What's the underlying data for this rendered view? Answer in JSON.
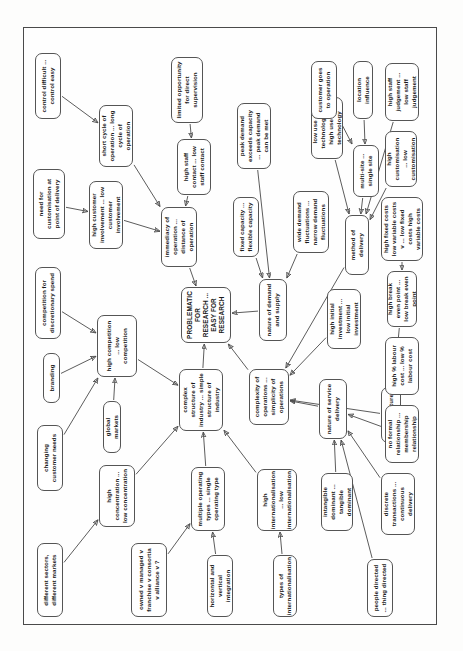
{
  "diagram": {
    "type": "concept-map",
    "title": "PROBLEMATIC FOR RESEARCH ... EASY FOR RESEARCH",
    "orientation": "rotated-90",
    "nodes": [
      {
        "id": "different-sectors",
        "label": "different sectors, different markets"
      },
      {
        "id": "changing-customer-needs",
        "label": "changing customer needs"
      },
      {
        "id": "branding",
        "label": "branding"
      },
      {
        "id": "competition-discretionary",
        "label": "competition for discretionary spend"
      },
      {
        "id": "need-customisation",
        "label": "need for customisation at point of delivery"
      },
      {
        "id": "control-difficult",
        "label": "control difficult ... control easy"
      },
      {
        "id": "high-concentration",
        "label": "high concentration ... low concentration"
      },
      {
        "id": "global-markets",
        "label": "global markets"
      },
      {
        "id": "high-competition",
        "label": "high competition ... low competition"
      },
      {
        "id": "high-customer-involvement",
        "label": "high customer involvement ... low customer involvement"
      },
      {
        "id": "short-cycle",
        "label": "short cycle of operation ... long cycle of operation"
      },
      {
        "id": "owned-v-managed",
        "label": "owned v managed v franchise v consortia v alliance v ?"
      },
      {
        "id": "immediacy-of-operation",
        "label": "immediacy of operation ... distance of operation"
      },
      {
        "id": "high-staff-contact",
        "label": "high staff contact ... low staff contact"
      },
      {
        "id": "limited-supervision",
        "label": "limited opportunity for direct supervision"
      },
      {
        "id": "multiple-operating-types",
        "label": "multiple operating types ... single operating type"
      },
      {
        "id": "complex-structure",
        "label": "complex structure of industry ... simple structure of industry"
      },
      {
        "id": "problematic-research",
        "label": "PROBLEMATIC FOR RESEARCH ... EASY FOR RESEARCH"
      },
      {
        "id": "fixed-capacity",
        "label": "fixed capacity ... flexible capacity"
      },
      {
        "id": "peak-demand",
        "label": "peak demand exceeds capacity ... peak demand can be met"
      },
      {
        "id": "horizontal-vertical",
        "label": "horizontal and vertical integration"
      },
      {
        "id": "high-internationalisation",
        "label": "high internationalisation ... low internationalisation"
      },
      {
        "id": "complexity-operations",
        "label": "complexity of operations ... simplicity of operations"
      },
      {
        "id": "nature-demand-supply",
        "label": "nature of demand and supply"
      },
      {
        "id": "wide-demand-fluctuations",
        "label": "wide demand fluctuations ... narrow demand fluctuations"
      },
      {
        "id": "low-use-technology",
        "label": "low use of technology ... high use of technology"
      },
      {
        "id": "types-internationalisation",
        "label": "types of internationalisation"
      },
      {
        "id": "intangible-dominant",
        "label": "intangible dominant ... tangible dominant"
      },
      {
        "id": "nature-service-delivery",
        "label": "nature of service delivery"
      },
      {
        "id": "cost-structure",
        "label": "cost structure"
      },
      {
        "id": "high-initial-investment",
        "label": "high initial investment ... low initial investment"
      },
      {
        "id": "method-of-delivery",
        "label": "method of delivery"
      },
      {
        "id": "multi-site",
        "label": "multi-site ... single site"
      },
      {
        "id": "location-influence",
        "label": "location influence"
      },
      {
        "id": "people-directed",
        "label": "people directed ... thing directed"
      },
      {
        "id": "discrete-transactions",
        "label": "discrete transactions ... continuous delivery"
      },
      {
        "id": "no-formal-relationship",
        "label": "no formal relationship ... membership relationship"
      },
      {
        "id": "high-labour-cost",
        "label": "high % labour cost ... low % labour cost"
      },
      {
        "id": "high-break-even",
        "label": "high break even point ... low break even point"
      },
      {
        "id": "high-fixed-costs",
        "label": "high fixed costs low variable costs v ... low fixed costs high variable costs"
      },
      {
        "id": "high-customisation",
        "label": "high customisation ... low customisation"
      },
      {
        "id": "high-staff-judgement",
        "label": "high staff judgement ... low staff judgement"
      },
      {
        "id": "customer-goes-to-operation",
        "label": "customer goes to operation"
      }
    ],
    "edges": [
      {
        "from": "different-sectors",
        "to": "high-concentration"
      },
      {
        "from": "changing-customer-needs",
        "to": "high-competition"
      },
      {
        "from": "branding",
        "to": "high-competition"
      },
      {
        "from": "competition-discretionary",
        "to": "high-competition"
      },
      {
        "from": "global-markets",
        "to": "high-competition"
      },
      {
        "from": "high-concentration",
        "to": "complex-structure"
      },
      {
        "from": "high-competition",
        "to": "complex-structure"
      },
      {
        "from": "owned-v-managed",
        "to": "multiple-operating-types"
      },
      {
        "from": "horizontal-vertical",
        "to": "multiple-operating-types"
      },
      {
        "from": "multiple-operating-types",
        "to": "complex-structure"
      },
      {
        "from": "high-internationalisation",
        "to": "complex-structure"
      },
      {
        "from": "complex-structure",
        "to": "problematic-research"
      },
      {
        "from": "need-customisation",
        "to": "high-customer-involvement"
      },
      {
        "from": "control-difficult",
        "to": "short-cycle"
      },
      {
        "from": "high-customer-involvement",
        "to": "immediacy-of-operation"
      },
      {
        "from": "short-cycle",
        "to": "immediacy-of-operation"
      },
      {
        "from": "high-staff-contact",
        "to": "immediacy-of-operation"
      },
      {
        "from": "limited-supervision",
        "to": "high-staff-contact"
      },
      {
        "from": "immediacy-of-operation",
        "to": "problematic-research"
      },
      {
        "from": "fixed-capacity",
        "to": "nature-demand-supply"
      },
      {
        "from": "peak-demand",
        "to": "nature-demand-supply"
      },
      {
        "from": "wide-demand-fluctuations",
        "to": "nature-demand-supply"
      },
      {
        "from": "nature-demand-supply",
        "to": "problematic-research"
      },
      {
        "from": "complexity-operations",
        "to": "problematic-research"
      },
      {
        "from": "types-internationalisation",
        "to": "high-internationalisation"
      },
      {
        "from": "intangible-dominant",
        "to": "nature-service-delivery"
      },
      {
        "from": "people-directed",
        "to": "nature-service-delivery"
      },
      {
        "from": "discrete-transactions",
        "to": "nature-service-delivery"
      },
      {
        "from": "no-formal-relationship",
        "to": "nature-service-delivery"
      },
      {
        "from": "nature-service-delivery",
        "to": "complexity-operations"
      },
      {
        "from": "cost-structure",
        "to": "complexity-operations"
      },
      {
        "from": "high-labour-cost",
        "to": "cost-structure"
      },
      {
        "from": "high-break-even",
        "to": "cost-structure"
      },
      {
        "from": "high-fixed-costs",
        "to": "high-break-even"
      },
      {
        "from": "high-initial-investment",
        "to": "complexity-operations"
      },
      {
        "from": "method-of-delivery",
        "to": "complexity-operations"
      },
      {
        "from": "low-use-technology",
        "to": "method-of-delivery"
      },
      {
        "from": "multi-site",
        "to": "method-of-delivery"
      },
      {
        "from": "location-influence",
        "to": "multi-site"
      },
      {
        "from": "customer-goes-to-operation",
        "to": "multi-site"
      },
      {
        "from": "high-customisation",
        "to": "method-of-delivery"
      },
      {
        "from": "high-staff-judgement",
        "to": "method-of-delivery"
      }
    ]
  },
  "colors": {
    "box_border": "#555555",
    "line": "#4a4a4a",
    "text": "#1a1a1a",
    "page_background": "#fdfdfc",
    "frame_border": "#4a4a4a"
  }
}
